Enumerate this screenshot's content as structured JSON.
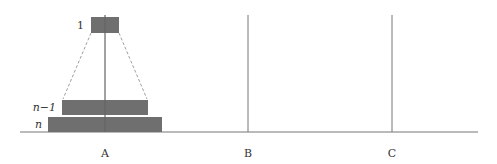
{
  "diagram": {
    "pegs": [
      {
        "label": "A",
        "x": 105
      },
      {
        "label": "B",
        "x": 248
      },
      {
        "label": "C",
        "x": 392
      }
    ],
    "disks": [
      {
        "label": "1",
        "peg": "A",
        "x": 91,
        "y": 17,
        "w": 28,
        "h": 16
      },
      {
        "label": "n−1",
        "peg": "A",
        "x": 62,
        "y": 100,
        "w": 86,
        "h": 15
      },
      {
        "label": "n",
        "peg": "A",
        "x": 48,
        "y": 117,
        "w": 114,
        "h": 15
      }
    ],
    "colors": {
      "disk": "#6f6f6f",
      "line": "#777777"
    }
  }
}
